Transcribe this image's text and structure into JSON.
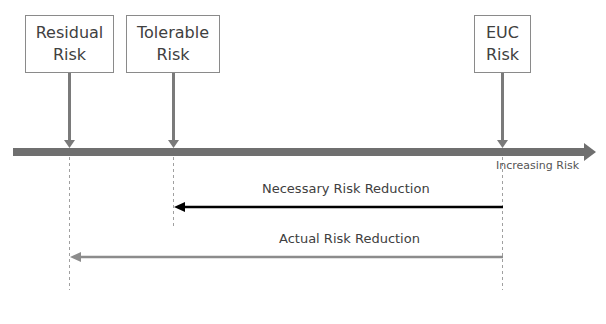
{
  "diagram": {
    "boxes": [
      {
        "id": "residual",
        "line1": "Residual",
        "line2": "Risk"
      },
      {
        "id": "tolerable",
        "line1": "Tolerable",
        "line2": "Risk"
      },
      {
        "id": "euc",
        "line1": "EUC",
        "line2": "Risk"
      }
    ],
    "axis_label": "Increasing Risk",
    "necessary_label": "Necessary Risk Reduction",
    "actual_label": "Actual Risk Reduction",
    "colors": {
      "axis": "#6f6f6f",
      "pointer": "#7a7a7a",
      "necessary_arrow": "#000000",
      "actual_arrow": "#8c8c8c",
      "dashed": "#a0a0a0",
      "text": "#404040"
    }
  }
}
